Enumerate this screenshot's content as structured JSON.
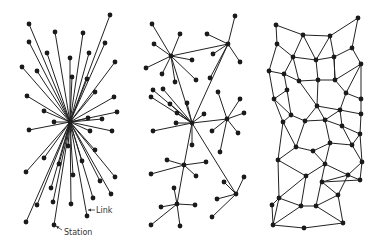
{
  "diagram": {
    "title": "",
    "colors": {
      "background": "#ffffff",
      "line": "#222222",
      "node": "#1a1a1a",
      "label": "#333333"
    },
    "labels": {
      "link": {
        "text": "Link",
        "x": 96,
        "y": 213,
        "arrow_from": [
          95,
          210
        ],
        "arrow_to": [
          88,
          210
        ]
      },
      "station": {
        "text": "Station",
        "x": 64,
        "y": 235,
        "arrow_from": [
          62,
          230
        ],
        "arrow_to": [
          56,
          226
        ]
      }
    },
    "centralized": {
      "center": [
        70,
        122
      ],
      "nodes": [
        [
          29,
          24
        ],
        [
          55,
          32
        ],
        [
          83,
          33
        ],
        [
          110,
          15
        ],
        [
          29,
          42
        ],
        [
          47,
          53
        ],
        [
          89,
          53
        ],
        [
          105,
          43
        ],
        [
          22,
          67
        ],
        [
          37,
          71
        ],
        [
          70,
          58
        ],
        [
          72,
          77
        ],
        [
          87,
          79
        ],
        [
          115,
          62
        ],
        [
          27,
          96
        ],
        [
          44,
          111
        ],
        [
          95,
          92
        ],
        [
          114,
          97
        ],
        [
          117,
          112
        ],
        [
          88,
          118
        ],
        [
          102,
          119
        ],
        [
          54,
          122
        ],
        [
          29,
          130
        ],
        [
          90,
          131
        ],
        [
          112,
          131
        ],
        [
          68,
          146
        ],
        [
          95,
          150
        ],
        [
          44,
          158
        ],
        [
          59,
          164
        ],
        [
          82,
          161
        ],
        [
          26,
          172
        ],
        [
          73,
          175
        ],
        [
          115,
          177
        ],
        [
          100,
          181
        ],
        [
          51,
          188
        ],
        [
          111,
          194
        ],
        [
          37,
          205
        ],
        [
          53,
          202
        ],
        [
          71,
          204
        ],
        [
          93,
          198
        ],
        [
          87,
          216
        ],
        [
          26,
          222
        ],
        [
          54,
          225
        ]
      ]
    },
    "decentralized": {
      "hubs": [
        [
          171,
          56
        ],
        [
          228,
          44
        ],
        [
          192,
          123
        ],
        [
          227,
          119
        ],
        [
          184,
          165
        ],
        [
          177,
          204
        ],
        [
          236,
          194
        ]
      ],
      "hub_links": [
        [
          0,
          1
        ],
        [
          0,
          2
        ],
        [
          1,
          2
        ],
        [
          2,
          3
        ],
        [
          2,
          4
        ],
        [
          4,
          5
        ],
        [
          2,
          6
        ]
      ],
      "spokes": [
        [
          0,
          152,
          24
        ],
        [
          0,
          180,
          34
        ],
        [
          0,
          154,
          44
        ],
        [
          0,
          146,
          68
        ],
        [
          0,
          162,
          74
        ],
        [
          0,
          192,
          60
        ],
        [
          0,
          175,
          82
        ],
        [
          0,
          196,
          80
        ],
        [
          1,
          235,
          16
        ],
        [
          1,
          207,
          34
        ],
        [
          1,
          213,
          54
        ],
        [
          1,
          240,
          62
        ],
        [
          1,
          210,
          78
        ],
        [
          2,
          153,
          90
        ],
        [
          2,
          163,
          89
        ],
        [
          2,
          151,
          97
        ],
        [
          2,
          170,
          104
        ],
        [
          2,
          177,
          113
        ],
        [
          2,
          187,
          103
        ],
        [
          2,
          176,
          123
        ],
        [
          2,
          153,
          131
        ],
        [
          2,
          192,
          145
        ],
        [
          2,
          204,
          114
        ],
        [
          3,
          218,
          92
        ],
        [
          3,
          240,
          99
        ],
        [
          3,
          244,
          113
        ],
        [
          3,
          212,
          131
        ],
        [
          3,
          238,
          133
        ],
        [
          3,
          220,
          152
        ],
        [
          4,
          167,
          160
        ],
        [
          4,
          206,
          162
        ],
        [
          4,
          151,
          174
        ],
        [
          4,
          196,
          176
        ],
        [
          5,
          174,
          188
        ],
        [
          5,
          161,
          207
        ],
        [
          5,
          195,
          205
        ],
        [
          5,
          151,
          225
        ],
        [
          5,
          180,
          226
        ],
        [
          6,
          224,
          182
        ],
        [
          6,
          244,
          177
        ],
        [
          6,
          217,
          199
        ],
        [
          6,
          212,
          217
        ]
      ]
    },
    "distributed": {
      "nodes": [
        [
          276,
          25
        ],
        [
          358,
          18
        ],
        [
          303,
          35
        ],
        [
          330,
          36
        ],
        [
          277,
          44
        ],
        [
          352,
          48
        ],
        [
          293,
          57
        ],
        [
          316,
          60
        ],
        [
          334,
          57
        ],
        [
          269,
          71
        ],
        [
          284,
          74
        ],
        [
          361,
          64
        ],
        [
          299,
          81
        ],
        [
          318,
          80
        ],
        [
          335,
          80
        ],
        [
          287,
          90
        ],
        [
          346,
          93
        ],
        [
          274,
          99
        ],
        [
          317,
          106
        ],
        [
          361,
          99
        ],
        [
          291,
          115
        ],
        [
          340,
          110
        ],
        [
          361,
          114
        ],
        [
          283,
          122
        ],
        [
          305,
          121
        ],
        [
          325,
          120
        ],
        [
          342,
          126
        ],
        [
          360,
          134
        ],
        [
          296,
          147
        ],
        [
          313,
          151
        ],
        [
          330,
          143
        ],
        [
          352,
          145
        ],
        [
          278,
          160
        ],
        [
          325,
          164
        ],
        [
          362,
          162
        ],
        [
          306,
          176
        ],
        [
          348,
          175
        ],
        [
          360,
          180
        ],
        [
          272,
          205
        ],
        [
          322,
          182
        ],
        [
          279,
          198
        ],
        [
          301,
          206
        ],
        [
          316,
          206
        ],
        [
          338,
          195
        ],
        [
          343,
          223
        ],
        [
          273,
          225
        ],
        [
          304,
          228
        ]
      ],
      "edges": [
        [
          0,
          2
        ],
        [
          2,
          3
        ],
        [
          3,
          1
        ],
        [
          0,
          4
        ],
        [
          1,
          5
        ],
        [
          4,
          6
        ],
        [
          2,
          6
        ],
        [
          2,
          7
        ],
        [
          3,
          7
        ],
        [
          3,
          8
        ],
        [
          8,
          5
        ],
        [
          6,
          7
        ],
        [
          7,
          8
        ],
        [
          4,
          9
        ],
        [
          6,
          10
        ],
        [
          9,
          10
        ],
        [
          5,
          11
        ],
        [
          8,
          14
        ],
        [
          11,
          14
        ],
        [
          6,
          12
        ],
        [
          7,
          13
        ],
        [
          8,
          14
        ],
        [
          12,
          13
        ],
        [
          13,
          14
        ],
        [
          10,
          15
        ],
        [
          9,
          17
        ],
        [
          15,
          17
        ],
        [
          10,
          12
        ],
        [
          11,
          16
        ],
        [
          14,
          16
        ],
        [
          15,
          20
        ],
        [
          17,
          20
        ],
        [
          12,
          18
        ],
        [
          13,
          18
        ],
        [
          16,
          19
        ],
        [
          16,
          21
        ],
        [
          11,
          19
        ],
        [
          20,
          23
        ],
        [
          17,
          23
        ],
        [
          20,
          24
        ],
        [
          18,
          24
        ],
        [
          18,
          25
        ],
        [
          24,
          25
        ],
        [
          18,
          21
        ],
        [
          21,
          25
        ],
        [
          21,
          22
        ],
        [
          19,
          22
        ],
        [
          21,
          26
        ],
        [
          25,
          26
        ],
        [
          22,
          27
        ],
        [
          26,
          27
        ],
        [
          23,
          28
        ],
        [
          24,
          28
        ],
        [
          28,
          29
        ],
        [
          29,
          30
        ],
        [
          25,
          30
        ],
        [
          30,
          31
        ],
        [
          26,
          31
        ],
        [
          27,
          31
        ],
        [
          23,
          32
        ],
        [
          28,
          32
        ],
        [
          29,
          33
        ],
        [
          30,
          33
        ],
        [
          31,
          34
        ],
        [
          27,
          34
        ],
        [
          32,
          35
        ],
        [
          33,
          35
        ],
        [
          33,
          36
        ],
        [
          34,
          36
        ],
        [
          34,
          37
        ],
        [
          36,
          37
        ],
        [
          32,
          40
        ],
        [
          35,
          40
        ],
        [
          35,
          41
        ],
        [
          40,
          41
        ],
        [
          41,
          42
        ],
        [
          33,
          42
        ],
        [
          42,
          43
        ],
        [
          36,
          43
        ],
        [
          39,
          43
        ],
        [
          36,
          39
        ],
        [
          37,
          39
        ],
        [
          38,
          40
        ],
        [
          38,
          45
        ],
        [
          40,
          45
        ],
        [
          41,
          45
        ],
        [
          45,
          46
        ],
        [
          46,
          44
        ],
        [
          42,
          44
        ],
        [
          43,
          44
        ]
      ]
    }
  }
}
